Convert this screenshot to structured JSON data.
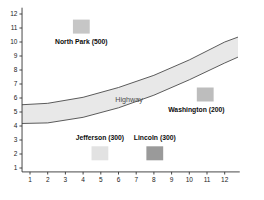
{
  "chart_data": {
    "type": "scatter",
    "title": "",
    "xlabel": "",
    "ylabel": "",
    "xlim": [
      0.5,
      12.9
    ],
    "ylim": [
      0.6,
      12.4
    ],
    "grid": false,
    "legend": "none",
    "xticks": [
      1,
      2,
      3,
      4,
      5,
      6,
      7,
      8,
      9,
      10,
      11,
      12
    ],
    "yticks": [
      1,
      2,
      3,
      4,
      5,
      6,
      7,
      8,
      9,
      10,
      11,
      12
    ],
    "annotations": [
      {
        "text": "Highway",
        "x": 6.6,
        "y": 5.9,
        "color": "#4d4d4d"
      }
    ],
    "band": {
      "name": "Highway",
      "fill": "#e8e8e8",
      "stroke": "#4a4a4a",
      "upper_points": [
        {
          "x": 0.55,
          "y": 5.52
        },
        {
          "x": 2.0,
          "y": 5.62
        },
        {
          "x": 4.0,
          "y": 6.05
        },
        {
          "x": 6.0,
          "y": 6.75
        },
        {
          "x": 8.0,
          "y": 7.62
        },
        {
          "x": 10.0,
          "y": 8.72
        },
        {
          "x": 12.0,
          "y": 10.0
        },
        {
          "x": 12.75,
          "y": 10.35
        }
      ],
      "lower_points": [
        {
          "x": 0.55,
          "y": 4.18
        },
        {
          "x": 2.0,
          "y": 4.22
        },
        {
          "x": 4.0,
          "y": 4.62
        },
        {
          "x": 6.0,
          "y": 5.3
        },
        {
          "x": 8.0,
          "y": 6.2
        },
        {
          "x": 10.0,
          "y": 7.3
        },
        {
          "x": 12.0,
          "y": 8.5
        },
        {
          "x": 12.75,
          "y": 8.92
        }
      ]
    },
    "markers": [
      {
        "id": "north-park",
        "label": "North Park (500)",
        "value": 500,
        "x": 3.9,
        "y": 11.1,
        "color": "#c6c6c6",
        "w_units": 0.95,
        "h_units": 1.0,
        "label_x": 3.9,
        "label_y": 10.0
      },
      {
        "id": "washington",
        "label": "Washington (200)",
        "value": 200,
        "x": 10.9,
        "y": 6.25,
        "color": "#bdbdbd",
        "w_units": 0.95,
        "h_units": 1.0,
        "label_x": 10.4,
        "label_y": 5.15
      },
      {
        "id": "jefferson",
        "label": "Jefferson (300)",
        "value": 300,
        "x": 4.95,
        "y": 2.05,
        "color": "#e2e2e2",
        "w_units": 0.95,
        "h_units": 1.0,
        "label_x": 4.95,
        "label_y": 3.15
      },
      {
        "id": "lincoln",
        "label": "Lincoln (300)",
        "value": 300,
        "x": 8.05,
        "y": 2.05,
        "color": "#9a9a9a",
        "w_units": 0.95,
        "h_units": 1.0,
        "label_x": 8.05,
        "label_y": 3.15
      }
    ],
    "axis_color": "#333333"
  }
}
